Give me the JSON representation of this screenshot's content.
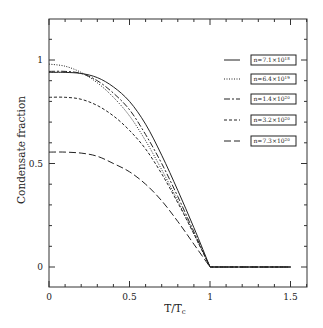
{
  "chart_data": {
    "type": "line",
    "title": "",
    "xlabel": "T/T",
    "xlabel_subscript": "c",
    "ylabel": "Condensate fraction",
    "xlim": [
      0,
      1.6
    ],
    "ylim": [
      -0.1,
      1.2
    ],
    "xticks": [
      0,
      0.5,
      1,
      1.5
    ],
    "xtick_labels": [
      "0",
      "0.5",
      "1",
      "1.5"
    ],
    "yticks": [
      0,
      0.5,
      1
    ],
    "ytick_labels": [
      "0",
      "0.5",
      "1"
    ],
    "minor_tick_step": 0.1,
    "grid": false,
    "legend_position": "upper right",
    "x": [
      0.0,
      0.1,
      0.2,
      0.3,
      0.4,
      0.5,
      0.6,
      0.7,
      0.8,
      0.9,
      1.0,
      1.5
    ],
    "series": [
      {
        "name": "n=7.1×10¹⁸",
        "label_base": "n=7.1×10",
        "label_exp": "18",
        "style": "solid",
        "values": [
          0.94,
          0.94,
          0.935,
          0.915,
          0.87,
          0.8,
          0.69,
          0.54,
          0.37,
          0.19,
          0.0,
          0.0
        ]
      },
      {
        "name": "n=6.4×10¹⁹",
        "label_base": "n=6.4×10",
        "label_exp": "19",
        "style": "dotted",
        "values": [
          0.98,
          0.97,
          0.94,
          0.89,
          0.82,
          0.73,
          0.61,
          0.47,
          0.32,
          0.16,
          0.0,
          0.0
        ]
      },
      {
        "name": "n=1.4×10²⁰",
        "label_base": "n=1.4×10",
        "label_exp": "20",
        "style": "long-short-dash",
        "values": [
          0.945,
          0.945,
          0.935,
          0.9,
          0.84,
          0.76,
          0.64,
          0.5,
          0.34,
          0.17,
          0.0,
          0.0
        ]
      },
      {
        "name": "n=3.2×10²⁰",
        "label_base": "n=3.2×10",
        "label_exp": "20",
        "style": "dashed",
        "values": [
          0.82,
          0.82,
          0.81,
          0.78,
          0.73,
          0.66,
          0.57,
          0.45,
          0.31,
          0.16,
          0.0,
          0.0
        ]
      },
      {
        "name": "n=7.3×10²⁰",
        "label_base": "n=7.3×10",
        "label_exp": "20",
        "style": "long-dash",
        "values": [
          0.555,
          0.555,
          0.55,
          0.535,
          0.5,
          0.46,
          0.4,
          0.32,
          0.22,
          0.11,
          0.0,
          0.0
        ]
      }
    ]
  }
}
